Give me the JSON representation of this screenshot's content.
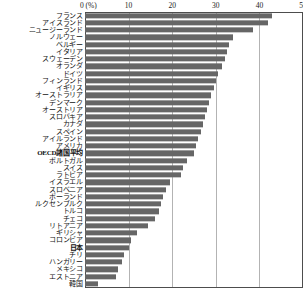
{
  "chart_data": {
    "type": "bar",
    "orientation": "horizontal",
    "title": "",
    "xlabel": "(%)",
    "ylabel": "",
    "xlim": [
      0,
      50
    ],
    "xticks": [
      0,
      10,
      20,
      30,
      40,
      50
    ],
    "xtick_labels": [
      "0",
      "10",
      "20",
      "30",
      "40",
      "50"
    ],
    "unit_label": "(%)",
    "grid": true,
    "grid_axis": "x",
    "legend": "none",
    "bar_color": "#666666",
    "categories": [
      "フランス",
      "アイスランド",
      "ニュージーランド",
      "ノルウェー",
      "ベルギー",
      "イタリア",
      "スウェーデン",
      "オランダ",
      "ドイツ",
      "フィンランド",
      "イギリス",
      "オーストラリア",
      "デンマーク",
      "オーストリア",
      "スロバキア",
      "カナダ",
      "スペイン",
      "アイルランド",
      "アメリカ",
      "OECD諸国平均",
      "ポルトガル",
      "スイス",
      "ラトビア",
      "イスラエル",
      "スロベニア",
      "ポーランド",
      "ルクセンブルク",
      "トルコ",
      "チェコ",
      "リトアニア",
      "ギリシャ",
      "コロンビア",
      "日本",
      "チリ",
      "ハンガリー",
      "メキシコ",
      "エストニア",
      "韓国"
    ],
    "values": [
      43.0,
      42.0,
      38.5,
      34.0,
      33.0,
      32.5,
      32.0,
      31.5,
      30.5,
      30.0,
      29.5,
      29.0,
      28.5,
      28.0,
      27.5,
      27.0,
      26.5,
      26.0,
      25.5,
      25.0,
      23.5,
      22.5,
      22.0,
      19.5,
      18.5,
      18.0,
      17.5,
      17.0,
      16.0,
      14.5,
      12.0,
      10.5,
      10.0,
      9.0,
      8.5,
      7.5,
      7.0,
      3.0
    ],
    "emphasized": [
      "OECD諸国平均",
      "日本"
    ]
  }
}
